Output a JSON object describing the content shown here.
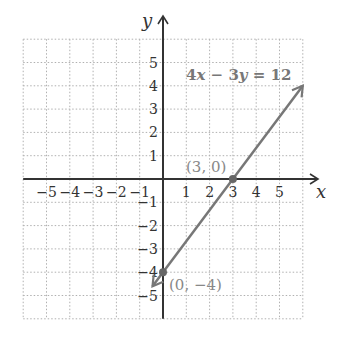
{
  "chart_data": {
    "type": "line",
    "title": "",
    "xlabel": "x",
    "ylabel": "y",
    "xlim": [
      -6,
      6
    ],
    "ylim": [
      -6,
      6
    ],
    "grid": true,
    "x_ticks": [
      -5,
      -4,
      -3,
      -2,
      -1,
      1,
      2,
      3,
      4,
      5
    ],
    "y_ticks": [
      5,
      4,
      3,
      2,
      1,
      -1,
      -2,
      -3,
      -4,
      -5
    ],
    "x_tick_labels": [
      "−5",
      "−4",
      "−3",
      "−2",
      "−1",
      "1",
      "2",
      "3",
      "4",
      "5"
    ],
    "y_tick_labels": [
      "5",
      "4",
      "3",
      "2",
      "1",
      "−1",
      "−2",
      "−3",
      "−4",
      "−5"
    ],
    "series": [
      {
        "name": "4x − 3y = 12",
        "equation": "4x - 3y = 12",
        "x": [
          -0.45,
          6
        ],
        "y": [
          -4.6,
          4
        ]
      }
    ],
    "points": [
      {
        "x": 3,
        "y": 0,
        "label": "(3, 0)"
      },
      {
        "x": 0,
        "y": -4,
        "label": "(0, −4)"
      }
    ],
    "annotations": [
      {
        "text": "4x − 3y = 12",
        "position": "upper right"
      },
      {
        "text": "(3, 0)"
      },
      {
        "text": "(0, −4)"
      }
    ],
    "colors": {
      "line": "#777777",
      "axes": "#333333",
      "grid": "#aaaaaa"
    }
  },
  "labels": {
    "x_axis": "x",
    "y_axis": "y",
    "equation_prefix": "4",
    "point_a": "(3, 0)",
    "point_b": "(0, −4)"
  }
}
